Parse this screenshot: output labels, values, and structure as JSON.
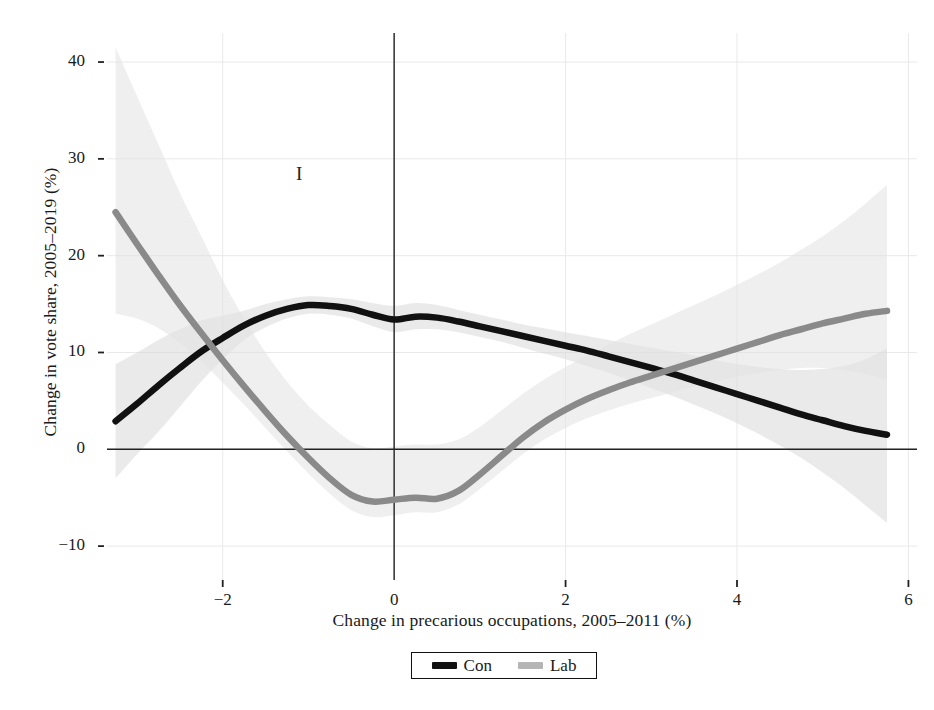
{
  "chart_data": {
    "type": "line",
    "title": "",
    "panel_annotation": "I",
    "xlabel": "Change in precarious occupations, 2005–2011 (%)",
    "ylabel": "Change in vote share, 2005–2019 (%)",
    "xlim": [
      -3.35,
      6.1
    ],
    "ylim": [
      -13.5,
      43
    ],
    "xticks": [
      -2,
      0,
      2,
      4,
      6
    ],
    "xtick_labels": [
      "−2",
      "0",
      "2",
      "4",
      "6"
    ],
    "yticks": [
      -10,
      0,
      10,
      20,
      30,
      40
    ],
    "ytick_labels": [
      "−10",
      "0",
      "10",
      "20",
      "30",
      "40"
    ],
    "grid": true,
    "grid_color": "#e9e9e9",
    "zero_lines": true,
    "legend_position": "below-center",
    "series": [
      {
        "name": "Con",
        "label": "Con",
        "color": "#111111",
        "band_color": "#d8d8d8",
        "x": [
          -3.25,
          -3.0,
          -2.75,
          -2.5,
          -2.25,
          -2.0,
          -1.75,
          -1.5,
          -1.25,
          -1.0,
          -0.75,
          -0.5,
          -0.25,
          0.0,
          0.25,
          0.5,
          0.75,
          1.0,
          1.25,
          1.5,
          1.75,
          2.0,
          2.25,
          2.5,
          2.75,
          3.0,
          3.25,
          3.5,
          3.75,
          4.0,
          4.25,
          4.5,
          4.75,
          5.0,
          5.25,
          5.5,
          5.75
        ],
        "y": [
          2.9,
          4.7,
          6.6,
          8.4,
          10.1,
          11.5,
          12.8,
          13.8,
          14.5,
          14.9,
          14.8,
          14.5,
          13.9,
          13.4,
          13.7,
          13.6,
          13.2,
          12.7,
          12.2,
          11.7,
          11.2,
          10.7,
          10.2,
          9.6,
          9.0,
          8.4,
          7.8,
          7.1,
          6.4,
          5.7,
          5.0,
          4.3,
          3.6,
          3.0,
          2.4,
          1.9,
          1.5
        ],
        "band_lower": [
          -3.0,
          -0.5,
          1.8,
          4.4,
          7.0,
          9.3,
          11.3,
          12.6,
          13.5,
          14.0,
          13.9,
          13.5,
          12.7,
          12.1,
          12.4,
          12.4,
          12.1,
          11.6,
          11.1,
          10.5,
          9.9,
          9.3,
          8.6,
          7.9,
          7.1,
          6.3,
          5.5,
          4.6,
          3.7,
          2.7,
          1.6,
          0.4,
          -0.9,
          -2.4,
          -4.0,
          -5.8,
          -7.6
        ],
        "band_upper": [
          8.8,
          10.0,
          11.3,
          12.4,
          13.3,
          13.8,
          14.3,
          15.0,
          15.5,
          15.8,
          15.7,
          15.5,
          15.1,
          14.8,
          15.1,
          14.9,
          14.4,
          13.9,
          13.4,
          12.9,
          12.5,
          12.1,
          11.7,
          11.3,
          10.9,
          10.5,
          10.1,
          9.7,
          9.2,
          8.8,
          8.5,
          8.3,
          8.2,
          8.3,
          8.6,
          9.3,
          10.4
        ]
      },
      {
        "name": "Lab",
        "label": "Lab",
        "color": "#8a8a8a",
        "band_color": "#e2e2e2",
        "x": [
          -3.25,
          -3.0,
          -2.75,
          -2.5,
          -2.25,
          -2.0,
          -1.75,
          -1.5,
          -1.25,
          -1.0,
          -0.75,
          -0.5,
          -0.25,
          0.0,
          0.25,
          0.5,
          0.75,
          1.0,
          1.25,
          1.5,
          1.75,
          2.0,
          2.25,
          2.5,
          2.75,
          3.0,
          3.25,
          3.5,
          3.75,
          4.0,
          4.25,
          4.5,
          4.75,
          5.0,
          5.25,
          5.5,
          5.75
        ],
        "y": [
          24.5,
          21.2,
          18.0,
          14.9,
          12.0,
          9.2,
          6.5,
          3.9,
          1.4,
          -0.9,
          -3.0,
          -4.7,
          -5.4,
          -5.2,
          -5.0,
          -5.1,
          -4.3,
          -2.6,
          -0.7,
          1.2,
          2.8,
          4.1,
          5.2,
          6.1,
          6.9,
          7.6,
          8.3,
          9.0,
          9.7,
          10.4,
          11.1,
          11.8,
          12.4,
          13.0,
          13.5,
          14.0,
          14.3
        ],
        "band_lower": [
          14.0,
          13.5,
          12.5,
          11.0,
          9.1,
          6.9,
          4.6,
          2.2,
          -0.2,
          -2.5,
          -4.6,
          -6.3,
          -7.0,
          -6.8,
          -6.5,
          -6.5,
          -5.7,
          -4.1,
          -2.3,
          -0.5,
          1.0,
          2.2,
          3.2,
          4.0,
          4.7,
          5.3,
          5.9,
          6.5,
          7.0,
          7.5,
          7.9,
          8.2,
          8.4,
          8.4,
          8.2,
          7.8,
          7.2
        ],
        "band_upper": [
          41.5,
          36.5,
          31.5,
          26.5,
          22.0,
          17.5,
          13.5,
          10.0,
          7.0,
          4.5,
          2.5,
          0.8,
          0.1,
          0.3,
          0.5,
          0.5,
          1.0,
          2.3,
          4.0,
          5.7,
          7.2,
          8.5,
          9.7,
          10.8,
          11.9,
          12.9,
          13.9,
          14.9,
          15.9,
          17.0,
          18.1,
          19.3,
          20.6,
          22.0,
          23.6,
          25.4,
          27.3
        ]
      }
    ]
  }
}
